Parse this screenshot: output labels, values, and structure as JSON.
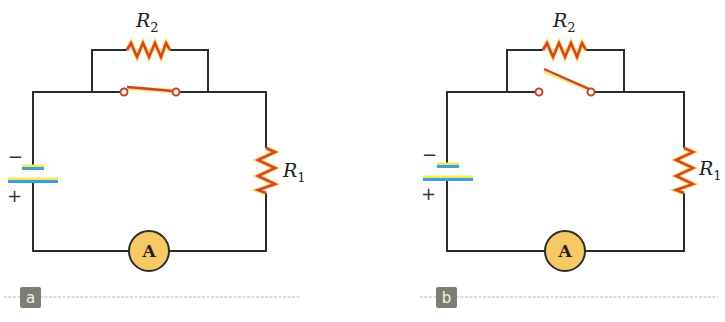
{
  "figure": {
    "panels": [
      {
        "id": "a",
        "tag": "a",
        "switch_state": "closed",
        "resistor_top": {
          "symbol": "R",
          "subscript": "2"
        },
        "resistor_right": {
          "symbol": "R",
          "subscript": "1"
        },
        "meter_label": "A",
        "battery": {
          "negative": "−",
          "positive": "+"
        }
      },
      {
        "id": "b",
        "tag": "b",
        "switch_state": "open",
        "resistor_top": {
          "symbol": "R",
          "subscript": "2"
        },
        "resistor_right": {
          "symbol": "R",
          "subscript": "1"
        },
        "meter_label": "A",
        "battery": {
          "negative": "−",
          "positive": "+"
        }
      }
    ],
    "colors": {
      "wire": "#2b2b2b",
      "resistor": "#d6452a",
      "battery_plate": "#3f9fd8",
      "ammeter_fill": "#f7c965",
      "tag_bg": "#7d7d72"
    }
  }
}
